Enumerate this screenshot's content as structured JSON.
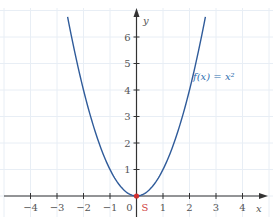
{
  "chart_data": {
    "type": "line",
    "title": "",
    "xlabel": "x",
    "ylabel": "y",
    "xlim": [
      -4.8,
      5.0
    ],
    "ylim": [
      -0.7,
      6.9
    ],
    "grid": true,
    "x_ticks": [
      -4,
      -3,
      -2,
      -1,
      0,
      1,
      2,
      3,
      4
    ],
    "x_tick_labels": [
      "−4",
      "−3",
      "−2",
      "−1",
      "0",
      "1",
      "2",
      "3",
      "4"
    ],
    "y_ticks": [
      1,
      2,
      3,
      4,
      5,
      6
    ],
    "y_tick_labels": [
      "1",
      "2",
      "3",
      "4",
      "5",
      "6"
    ],
    "series": [
      {
        "name": "f(x) = x²",
        "function": "x^2",
        "x_range": [
          -2.6,
          2.6
        ],
        "x": [
          -2.6,
          -2,
          -1.5,
          -1,
          -0.5,
          0,
          0.5,
          1,
          1.5,
          2,
          2.6
        ],
        "y": [
          6.76,
          4,
          2.25,
          1,
          0.25,
          0,
          0.25,
          1,
          2.25,
          4,
          6.76
        ],
        "color": "#2f5b9a"
      }
    ],
    "points": [
      {
        "label": "S",
        "x": 0,
        "y": 0,
        "color": "#d03030"
      }
    ],
    "annotations": [
      {
        "text": "f(x) = x²",
        "x": 2.1,
        "y": 4.5
      }
    ]
  },
  "labels": {
    "x_axis": "x",
    "y_axis": "y",
    "function": "f(x) = x²",
    "vertex": "S",
    "origin": "0"
  },
  "colors": {
    "curve": "#2f5b9a",
    "axis": "#333333",
    "grid": "#e8eef5",
    "point": "#d03030"
  }
}
